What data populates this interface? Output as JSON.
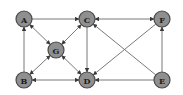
{
  "diagram": {
    "type": "directed-graph",
    "colors": {
      "node_fill": "#8f8f8f",
      "node_stroke": "#4a4a4a",
      "edge": "#6a6a6a",
      "background": "#ffffff"
    },
    "nodes": [
      {
        "id": "A",
        "label": "A",
        "x": 24,
        "y": 19
      },
      {
        "id": "C",
        "label": "C",
        "x": 87,
        "y": 19
      },
      {
        "id": "F",
        "label": "F",
        "x": 162,
        "y": 19
      },
      {
        "id": "G",
        "label": "G",
        "x": 56,
        "y": 50
      },
      {
        "id": "B",
        "label": "B",
        "x": 24,
        "y": 80
      },
      {
        "id": "D",
        "label": "D",
        "x": 87,
        "y": 80
      },
      {
        "id": "E",
        "label": "E",
        "x": 162,
        "y": 80
      }
    ],
    "edges": [
      {
        "from": "A",
        "to": "C",
        "bidirectional": false
      },
      {
        "from": "C",
        "to": "F",
        "bidirectional": true
      },
      {
        "from": "B",
        "to": "A",
        "bidirectional": false
      },
      {
        "from": "A",
        "to": "G",
        "bidirectional": true
      },
      {
        "from": "G",
        "to": "C",
        "bidirectional": true
      },
      {
        "from": "G",
        "to": "B",
        "bidirectional": true
      },
      {
        "from": "G",
        "to": "D",
        "bidirectional": true
      },
      {
        "from": "C",
        "to": "D",
        "bidirectional": false
      },
      {
        "from": "D",
        "to": "B",
        "bidirectional": true
      },
      {
        "from": "E",
        "to": "D",
        "bidirectional": false
      },
      {
        "from": "E",
        "to": "C",
        "bidirectional": false
      },
      {
        "from": "F",
        "to": "D",
        "bidirectional": false
      },
      {
        "from": "E",
        "to": "F",
        "bidirectional": false
      }
    ]
  }
}
